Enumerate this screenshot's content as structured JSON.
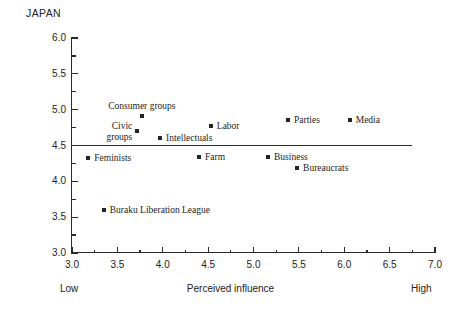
{
  "chart_data": {
    "type": "scatter",
    "title": "JAPAN",
    "xlabel": "Perceived influence",
    "ylabel": "Fair influence",
    "xlim": [
      3.0,
      7.0
    ],
    "ylim": [
      3.0,
      6.0
    ],
    "xticks": [
      "3.0",
      "3.5",
      "4.0",
      "4.5",
      "5.0",
      "5.5",
      "6.0",
      "6.5",
      "7.0"
    ],
    "xtick_values": [
      3.0,
      3.5,
      4.0,
      4.5,
      5.0,
      5.5,
      6.0,
      6.5,
      7.0
    ],
    "yticks": [
      "3.0",
      "3.5",
      "4.0",
      "4.5",
      "5.0",
      "5.5",
      "6.0"
    ],
    "ytick_values": [
      3.0,
      3.5,
      4.0,
      4.5,
      5.0,
      5.5,
      6.0
    ],
    "x_axis_low_label": "Low",
    "x_axis_high_label": "High",
    "grid": false,
    "legend": "none",
    "reference_line": {
      "orientation": "horizontal",
      "y": 4.5,
      "x_start": 3.0,
      "x_end": 6.75
    },
    "points": [
      {
        "label": "Consumer groups",
        "x": 3.77,
        "y": 4.91,
        "label_pos": "above"
      },
      {
        "label": "Civic\ngroups",
        "x": 3.72,
        "y": 4.7,
        "label_pos": "left"
      },
      {
        "label": "Intellectuals",
        "x": 3.97,
        "y": 4.61,
        "label_pos": "right"
      },
      {
        "label": "Labor",
        "x": 4.53,
        "y": 4.77,
        "label_pos": "right"
      },
      {
        "label": "Parties",
        "x": 5.38,
        "y": 4.85,
        "label_pos": "right"
      },
      {
        "label": "Media",
        "x": 6.06,
        "y": 4.85,
        "label_pos": "right"
      },
      {
        "label": "Feminists",
        "x": 3.18,
        "y": 4.33,
        "label_pos": "right"
      },
      {
        "label": "Farm",
        "x": 4.4,
        "y": 4.34,
        "label_pos": "right"
      },
      {
        "label": "Business",
        "x": 5.16,
        "y": 4.34,
        "label_pos": "right"
      },
      {
        "label": "Bureaucrats",
        "x": 5.48,
        "y": 4.18,
        "label_pos": "right"
      },
      {
        "label": "Buraku Liberation League",
        "x": 3.35,
        "y": 3.6,
        "label_pos": "right"
      }
    ]
  },
  "colors": {
    "axis": "#2b2b2b",
    "marker": "#242424",
    "text": "#1c1c1c",
    "background": "#ffffff"
  }
}
